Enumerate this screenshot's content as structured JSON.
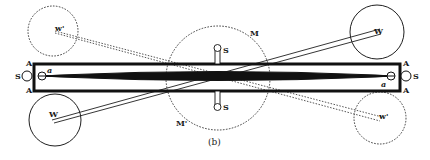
{
  "figure": {
    "caption": "(b)",
    "colors": {
      "ink": "#1a1a1a",
      "background": "#ffffff"
    },
    "labels": {
      "w_prime_top_left": "w'",
      "w_prime_bottom_right": "w'",
      "W_bottom_left": "W",
      "W_top_right": "W",
      "M_top": "M",
      "M_bottom": "M'",
      "S_top": "S",
      "S_bottom": "S",
      "S_left": "S",
      "S_right": "S",
      "A_left_top": "A",
      "A_left_bottom": "A",
      "A_right_top": "A",
      "A_right_bottom": "A",
      "a_left": "a",
      "a_right": "a"
    }
  }
}
